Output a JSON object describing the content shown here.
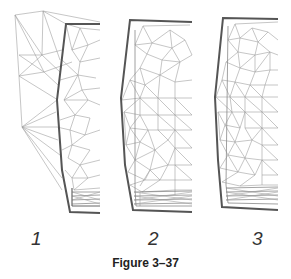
{
  "figure": {
    "caption": "Figure 3–37",
    "panels": [
      {
        "label": "1",
        "description": "Coarse mesh with extended outer triangulation"
      },
      {
        "label": "2",
        "description": "Refined triangular mesh"
      },
      {
        "label": "3",
        "description": "Further refined triangular mesh"
      }
    ],
    "colors": {
      "boundary": "#555555",
      "mesh": "#9a9a9a",
      "background": "#ffffff"
    }
  }
}
